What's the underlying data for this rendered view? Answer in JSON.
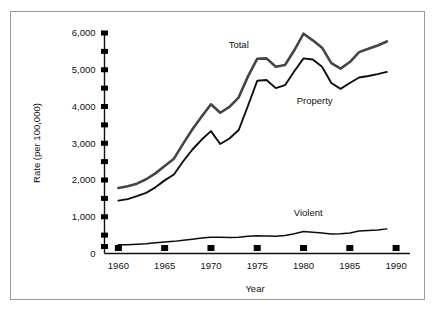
{
  "chart_data": {
    "type": "line",
    "title": "",
    "xlabel": "Year",
    "ylabel": "Rate (per 100,000)",
    "xlim": [
      1958.5,
      1991.5
    ],
    "ylim": [
      0,
      6000
    ],
    "grid": false,
    "legend_position": "inline-labels",
    "x_ticks": [
      1960,
      1965,
      1970,
      1975,
      1980,
      1985,
      1990
    ],
    "x_tick_labels": [
      "1960",
      "1965",
      "1970",
      "1975",
      "1980",
      "1985",
      "1990"
    ],
    "y_ticks": [
      0,
      1000,
      2000,
      3000,
      4000,
      5000,
      6000
    ],
    "y_tick_labels": [
      "0",
      "1,000",
      "2,000",
      "3,000",
      "4,000",
      "5,000",
      "6,000"
    ],
    "y_minor_ticks": [
      500,
      1500,
      2500,
      3500,
      4500,
      5500
    ],
    "x": [
      1960,
      1961,
      1962,
      1963,
      1964,
      1965,
      1966,
      1967,
      1968,
      1969,
      1970,
      1971,
      1972,
      1973,
      1974,
      1975,
      1976,
      1977,
      1978,
      1979,
      1980,
      1981,
      1982,
      1983,
      1984,
      1985,
      1986,
      1987,
      1988,
      1989
    ],
    "series": [
      {
        "name": "Total",
        "color": "#454545",
        "values": [
          1780,
          1830,
          1900,
          2020,
          2180,
          2380,
          2580,
          2990,
          3380,
          3730,
          4060,
          3830,
          3990,
          4250,
          4820,
          5300,
          5310,
          5080,
          5130,
          5530,
          5980,
          5800,
          5600,
          5180,
          5030,
          5210,
          5480,
          5570,
          5660,
          5770
        ]
      },
      {
        "name": "Property",
        "color": "#0d0d0d",
        "values": [
          1440,
          1480,
          1560,
          1650,
          1800,
          1990,
          2150,
          2510,
          2830,
          3100,
          3330,
          2980,
          3130,
          3360,
          4020,
          4700,
          4720,
          4500,
          4580,
          4960,
          5310,
          5280,
          5080,
          4640,
          4480,
          4640,
          4790,
          4830,
          4880,
          4940
        ]
      },
      {
        "name": "Violent",
        "color": "#0d0d0d",
        "values": [
          235,
          240,
          250,
          265,
          290,
          310,
          330,
          360,
          390,
          420,
          440,
          440,
          435,
          440,
          470,
          485,
          475,
          470,
          490,
          540,
          600,
          580,
          555,
          530,
          540,
          560,
          615,
          625,
          640,
          670
        ]
      }
    ],
    "annotations": [
      {
        "text": "Total",
        "x": 1973.0,
        "y": 5600
      },
      {
        "text": "Property",
        "x": 1981.2,
        "y": 4080
      },
      {
        "text": "Violent",
        "x": 1980.5,
        "y": 1020
      }
    ]
  }
}
